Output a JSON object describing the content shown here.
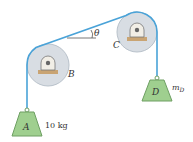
{
  "figure": {
    "type": "pulley-system",
    "colors": {
      "rope": "#4aa3d8",
      "pulley_fill": "#d8dde3",
      "pulley_stroke": "#b9c2cb",
      "block_fill": "#9fcf8f",
      "block_stroke": "#6e9f63",
      "bracket": "#c9a473",
      "text": "#333333"
    },
    "labels": {
      "pulley_B": "B",
      "pulley_C": "C",
      "block_A": "A",
      "block_A_mass": "10 kg",
      "block_D": "D",
      "block_D_mass_sym": "m",
      "block_D_mass_sub": "D",
      "angle": "θ"
    }
  }
}
